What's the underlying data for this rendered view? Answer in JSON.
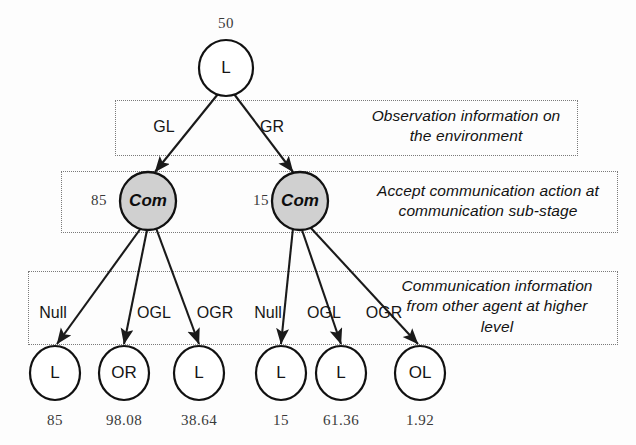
{
  "figure": {
    "type": "tree-diagram"
  },
  "nodes": {
    "root": {
      "label": "L",
      "value": "50"
    },
    "com_left": {
      "label": "Com",
      "value": "85"
    },
    "com_right": {
      "label": "Com",
      "value": "15"
    },
    "leaves": [
      {
        "label": "L",
        "value": "85"
      },
      {
        "label": "OR",
        "value": "98.08"
      },
      {
        "label": "L",
        "value": "38.64"
      },
      {
        "label": "L",
        "value": "15"
      },
      {
        "label": "L",
        "value": "61.36"
      },
      {
        "label": "OL",
        "value": "1.92"
      }
    ]
  },
  "edges": {
    "level1": [
      {
        "label": "GL"
      },
      {
        "label": "GR"
      }
    ],
    "level2_left": [
      {
        "label": "Null"
      },
      {
        "label": "OGL"
      },
      {
        "label": "OGR"
      }
    ],
    "level2_right": [
      {
        "label": "Null"
      },
      {
        "label": "OGL"
      },
      {
        "label": "OGR"
      }
    ]
  },
  "annotations": [
    {
      "line1": "Observation information on",
      "line2": "the environment",
      "line3": ""
    },
    {
      "line1": "Accept communication action at",
      "line2": "communication sub-stage",
      "line3": ""
    },
    {
      "line1": "Communication information",
      "line2": "from other agent at higher",
      "line3": "level"
    }
  ],
  "colors": {
    "com_fill": "#d0d0d0",
    "node_stroke": "#111111",
    "edge": "#1a1a1a",
    "dash": "#7a7a7a",
    "background": "#fdfdfd"
  }
}
